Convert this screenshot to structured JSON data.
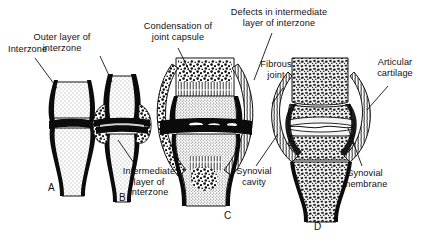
{
  "figure": {
    "background_color": "#ffffff",
    "ink_color": "#111111",
    "width": 423,
    "height": 241
  },
  "labels": [
    {
      "id": "interzone",
      "text": "Interzone",
      "x": 8,
      "y": 44,
      "align": "left"
    },
    {
      "id": "outer-layer",
      "text": "Outer layer of\ninterzone",
      "x": 62,
      "y": 32,
      "align": "center"
    },
    {
      "id": "condensation",
      "text": "Condensation of\njoint capsule",
      "x": 137,
      "y": 21,
      "align": "center"
    },
    {
      "id": "defects",
      "text": "Defects in intermediate\nlayer of interzone",
      "x": 220,
      "y": 7,
      "align": "center"
    },
    {
      "id": "fibrous-joint",
      "text": "Fibrous\njoint",
      "x": 253,
      "y": 59,
      "align": "center"
    },
    {
      "id": "articular-cartilage",
      "text": "Articular\ncartilage",
      "x": 369,
      "y": 57,
      "align": "center"
    },
    {
      "id": "intermediate-layer",
      "text": "Intermediate\nlayer of\ninterzone",
      "x": 142,
      "y": 168,
      "align": "center"
    },
    {
      "id": "synovial-cavity",
      "text": "Synovial\ncavity",
      "x": 250,
      "y": 168,
      "align": "center"
    },
    {
      "id": "synovial-membrane",
      "text": "Synovial\nmembrane",
      "x": 360,
      "y": 170,
      "align": "center"
    }
  ],
  "panels": [
    {
      "id": "A",
      "letter": "A",
      "x": 48,
      "y": 183,
      "caption": "Earliest stage: continuous interzone between cartilaginous bone ends"
    },
    {
      "id": "B",
      "letter": "B",
      "x": 119,
      "y": 193,
      "caption": "Interzone differentiates into outer and intermediate layers"
    },
    {
      "id": "C",
      "letter": "C",
      "x": 224,
      "y": 211,
      "caption": "Capsule condenses; cavities appear in intermediate layer"
    },
    {
      "id": "D",
      "letter": "D",
      "x": 314,
      "y": 222,
      "caption": "Mature synovial joint with cavity, cartilage and membrane"
    }
  ],
  "leaders": [
    {
      "id": "leader-interzone",
      "from": [
        35,
        58
      ],
      "to": [
        57,
        88
      ]
    },
    {
      "id": "leader-outer-layer",
      "from": [
        100,
        56
      ],
      "to": [
        112,
        82
      ]
    },
    {
      "id": "leader-condensation",
      "from": [
        178,
        48
      ],
      "to": [
        190,
        72
      ]
    },
    {
      "id": "leader-defects",
      "from": [
        272,
        33
      ],
      "to": [
        254,
        80
      ]
    },
    {
      "id": "leader-fibrous-joint",
      "from": [
        283,
        88
      ],
      "to": [
        272,
        104
      ]
    },
    {
      "id": "leader-articular-cartilage",
      "from": [
        388,
        86
      ],
      "to": [
        367,
        110
      ]
    },
    {
      "id": "leader-intermediate",
      "from": [
        136,
        166
      ],
      "to": [
        118,
        140
      ]
    },
    {
      "id": "leader-synovial-cavity",
      "from": [
        256,
        166
      ],
      "to": [
        278,
        134
      ]
    },
    {
      "id": "leader-synovial-membrane",
      "from": [
        362,
        166
      ],
      "to": [
        348,
        128
      ]
    }
  ]
}
